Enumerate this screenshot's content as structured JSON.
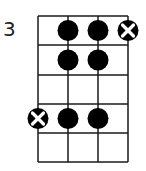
{
  "diagram": {
    "type": "fretboard-chord-diagram",
    "start_fret_label": "3",
    "strings": 4,
    "frets": 5,
    "grid": {
      "x": [
        38,
        68,
        98,
        128
      ],
      "y": [
        16,
        45,
        75,
        104,
        133,
        162
      ]
    },
    "dots": [
      {
        "string": 2,
        "fret": 1,
        "kind": "filled"
      },
      {
        "string": 3,
        "fret": 1,
        "kind": "filled"
      },
      {
        "string": 4,
        "fret": 1,
        "kind": "x"
      },
      {
        "string": 2,
        "fret": 2,
        "kind": "filled"
      },
      {
        "string": 3,
        "fret": 2,
        "kind": "filled"
      },
      {
        "string": 1,
        "fret": 4,
        "kind": "x"
      },
      {
        "string": 2,
        "fret": 4,
        "kind": "filled"
      },
      {
        "string": 3,
        "fret": 4,
        "kind": "filled"
      }
    ],
    "colors": {
      "line": "#1a1a1a",
      "dot": "#000000",
      "x_mark": "#ffffff"
    }
  }
}
